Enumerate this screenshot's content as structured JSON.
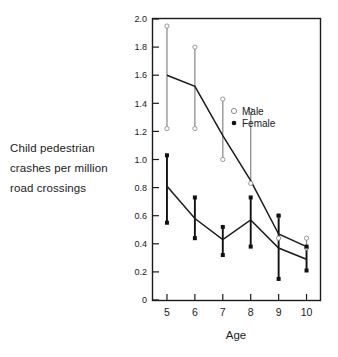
{
  "figure": {
    "caption_lines": [
      "Child pedestrian",
      "crashes per million",
      "road crossings"
    ],
    "colors": {
      "ink": "#1b1b1b",
      "frame": "#1b1b1b",
      "male_marker": "#9a9a9a",
      "female_marker": "#111111"
    }
  },
  "chart_data": {
    "type": "line",
    "title": "",
    "xlabel": "Age",
    "ylabel": "Child pedestrian crashes per million road crossings",
    "categories": [
      5,
      6,
      7,
      8,
      9,
      10
    ],
    "x": [
      5,
      6,
      7,
      8,
      9,
      10
    ],
    "xlim": [
      4.5,
      10.5
    ],
    "ylim": [
      0,
      2.0
    ],
    "ytick_labels": [
      "0",
      "0.2",
      "0.4",
      "0.6",
      "0.8",
      "1.0",
      "1.2",
      "1.4",
      "1.6",
      "1.8",
      "2.0"
    ],
    "yticks": [
      0,
      0.2,
      0.4,
      0.6,
      0.8,
      1.0,
      1.2,
      1.4,
      1.6,
      1.8,
      2.0
    ],
    "xtick_labels": [
      "5",
      "6",
      "7",
      "8",
      "9",
      "10"
    ],
    "grid": false,
    "legend_position": "upper right",
    "series": [
      {
        "name": "Male",
        "marker": "open-circle",
        "values": [
          1.6,
          1.52,
          1.17,
          0.85,
          0.47,
          0.38
        ],
        "error_high": [
          1.95,
          1.8,
          1.43,
          1.35,
          0.6,
          0.44
        ],
        "error_low": [
          1.22,
          1.22,
          1.0,
          0.83,
          0.44,
          0.37
        ]
      },
      {
        "name": "Female",
        "marker": "filled-dot",
        "values": [
          0.81,
          0.58,
          0.43,
          0.57,
          0.37,
          0.29
        ],
        "error_high": [
          1.03,
          0.73,
          0.52,
          0.73,
          0.6,
          0.38
        ],
        "error_low": [
          0.55,
          0.44,
          0.32,
          0.38,
          0.15,
          0.21
        ]
      }
    ],
    "legend": [
      {
        "label": "Male",
        "marker": "open-circle"
      },
      {
        "label": "Female",
        "marker": "filled-dot"
      }
    ]
  }
}
